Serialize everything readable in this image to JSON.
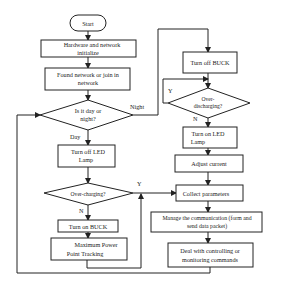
{
  "nodes": {
    "start": [
      "Start"
    ],
    "hw_init": [
      "Hardware and network",
      "initialize"
    ],
    "found_network": [
      "Found network or join in",
      "network"
    ],
    "day_night": [
      "Is it day or",
      "night?"
    ],
    "turn_off_led": [
      "Turn off LED",
      "Lamp"
    ],
    "over_charging": [
      "Over-charging?"
    ],
    "turn_on_buck": [
      "Turn on BUCK"
    ],
    "mppt": [
      "Maximum Power",
      "Point Tracking"
    ],
    "turn_off_buck": [
      "Turn off BUCK"
    ],
    "over_discharging": [
      "Over-",
      "discharging?"
    ],
    "turn_on_led": [
      "Turn on LED",
      "Lamp"
    ],
    "adjust_current": [
      "Adjust current"
    ],
    "collect_params": [
      "Collect parameters"
    ],
    "manage_comm": [
      "Manage the communication (form and",
      "send data packet)"
    ],
    "deal_commands": [
      "Deal with controlling or",
      "monitoring commands"
    ]
  },
  "edge_labels": {
    "night": "Night",
    "day": "Day",
    "charge_yes": "Y",
    "charge_no": "N",
    "discharge_yes": "Y",
    "discharge_no": "N"
  }
}
